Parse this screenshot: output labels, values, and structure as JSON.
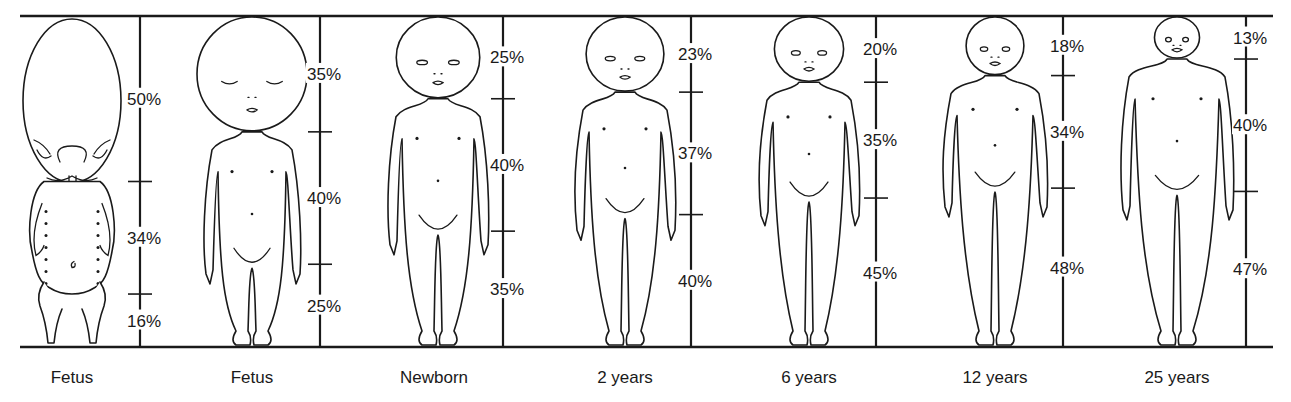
{
  "figure": {
    "ink_color": "#1a1a1a",
    "background_color": "#ffffff"
  },
  "stages": [
    {
      "label": "Fetus",
      "segments": [
        {
          "part": "head",
          "percent": "50%"
        },
        {
          "part": "trunk",
          "percent": "34%"
        },
        {
          "part": "legs",
          "percent": "16%"
        }
      ],
      "values": [
        50,
        34,
        16
      ],
      "figure_type": "early-fetus"
    },
    {
      "label": "Fetus",
      "segments": [
        {
          "part": "head",
          "percent": "35%"
        },
        {
          "part": "trunk",
          "percent": "40%"
        },
        {
          "part": "legs",
          "percent": "25%"
        }
      ],
      "values": [
        35,
        40,
        25
      ],
      "figure_type": "late-fetus"
    },
    {
      "label": "Newborn",
      "segments": [
        {
          "part": "head",
          "percent": "25%"
        },
        {
          "part": "trunk",
          "percent": "40%"
        },
        {
          "part": "legs",
          "percent": "35%"
        }
      ],
      "values": [
        25,
        40,
        35
      ],
      "figure_type": "child"
    },
    {
      "label": "2 years",
      "segments": [
        {
          "part": "head",
          "percent": "23%"
        },
        {
          "part": "trunk",
          "percent": "37%"
        },
        {
          "part": "legs",
          "percent": "40%"
        }
      ],
      "values": [
        23,
        37,
        40
      ],
      "figure_type": "child"
    },
    {
      "label": "6 years",
      "segments": [
        {
          "part": "head",
          "percent": "20%"
        },
        {
          "part": "trunk",
          "percent": "35%"
        },
        {
          "part": "legs",
          "percent": "45%"
        }
      ],
      "values": [
        20,
        35,
        45
      ],
      "figure_type": "child"
    },
    {
      "label": "12 years",
      "segments": [
        {
          "part": "head",
          "percent": "18%"
        },
        {
          "part": "trunk",
          "percent": "34%"
        },
        {
          "part": "legs",
          "percent": "48%"
        }
      ],
      "values": [
        18,
        34,
        48
      ],
      "figure_type": "adolescent"
    },
    {
      "label": "25 years",
      "segments": [
        {
          "part": "head",
          "percent": "13%"
        },
        {
          "part": "trunk",
          "percent": "40%"
        },
        {
          "part": "legs",
          "percent": "47%"
        }
      ],
      "values": [
        13,
        40,
        47
      ],
      "figure_type": "adult"
    }
  ]
}
